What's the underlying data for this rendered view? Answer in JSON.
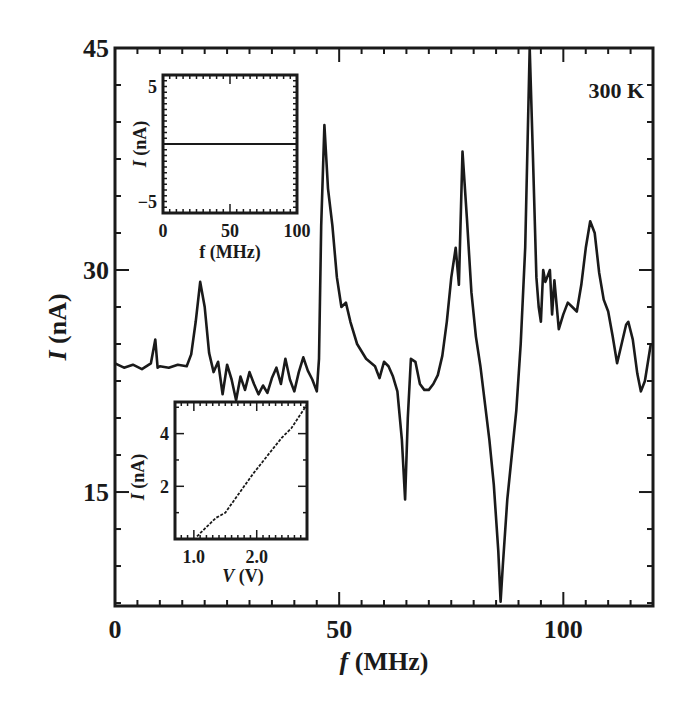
{
  "chart_data": {
    "type": "line",
    "title": "",
    "annotation": "300 K",
    "xlabel_italic": "f",
    "xlabel_rest": " (MHz)",
    "ylabel_italic": "I",
    "ylabel_rest": " (nA)",
    "xlim": [
      0,
      120
    ],
    "ylim": [
      7.3,
      45
    ],
    "xticks": [
      0,
      50,
      100
    ],
    "yticks": [
      15,
      30,
      45
    ],
    "grid": false,
    "legend": null,
    "series": [
      {
        "name": "I vs f at 300 K",
        "x": [
          0,
          2,
          4,
          6,
          8,
          9,
          9.5,
          10,
          12,
          14,
          16,
          17,
          18,
          19,
          20,
          21,
          22,
          23,
          24,
          25,
          26,
          27,
          28,
          29,
          30,
          31,
          32,
          33,
          34,
          35,
          36,
          37,
          38,
          39,
          40,
          41,
          42,
          43,
          44,
          45,
          45.5,
          46,
          46.7,
          47.5,
          48.5,
          49.5,
          50.5,
          51.5,
          52.5,
          54,
          56,
          58,
          59,
          60,
          61,
          62,
          63,
          64,
          64.7,
          65.3,
          66,
          67,
          68,
          69,
          70,
          71,
          72,
          73,
          74,
          75,
          76,
          76.7,
          77.5,
          78.5,
          79.5,
          80.5,
          81.5,
          82.5,
          83.5,
          84.5,
          85.5,
          86,
          86.5,
          87.5,
          88.5,
          89.5,
          90.5,
          91.5,
          92.5,
          93.2,
          94,
          94.5,
          95,
          95.5,
          96,
          97,
          97.5,
          98,
          99,
          100,
          101,
          102,
          103,
          104,
          105,
          106,
          107,
          108,
          109,
          110,
          111,
          112,
          113,
          114,
          114.5,
          115.5,
          116.5,
          117.3,
          118.2,
          119.5
        ],
        "y": [
          23.7,
          23.4,
          23.6,
          23.3,
          23.7,
          25.3,
          23.4,
          23.5,
          23.4,
          23.6,
          23.5,
          24.3,
          26.5,
          29.2,
          27.5,
          24.4,
          23.1,
          23.8,
          21.6,
          23.6,
          22.6,
          21.2,
          22.8,
          21.9,
          23.1,
          22.3,
          21.6,
          22.2,
          21.7,
          22.7,
          23.4,
          22.3,
          24.0,
          22.6,
          21.8,
          23.1,
          24.1,
          23.2,
          22.6,
          21.8,
          24.0,
          33.0,
          39.8,
          35.5,
          33.0,
          29.5,
          27.5,
          27.8,
          26.5,
          25.0,
          24.0,
          23.5,
          22.7,
          23.8,
          23.5,
          22.8,
          21.8,
          18.5,
          14.5,
          20.0,
          24.0,
          23.8,
          22.3,
          21.9,
          21.9,
          22.3,
          22.9,
          24.2,
          26.5,
          29.5,
          31.5,
          29.0,
          38.0,
          33.5,
          28.5,
          25.5,
          23.5,
          21.0,
          18.5,
          15.5,
          11.0,
          7.6,
          10.0,
          14.5,
          17.5,
          20.5,
          25.0,
          31.5,
          45.0,
          38.0,
          29.5,
          27.5,
          26.5,
          30.0,
          29.2,
          30.0,
          27.0,
          29.3,
          26.0,
          27.0,
          27.8,
          27.5,
          27.2,
          29.0,
          31.5,
          33.3,
          32.5,
          29.8,
          28.0,
          27.2,
          25.5,
          23.7,
          25.0,
          26.3,
          26.5,
          25.3,
          23.0,
          21.8,
          22.5,
          25.0
        ]
      }
    ],
    "insets": [
      {
        "type": "line",
        "position": "upper-left",
        "xlabel_italic": "",
        "xlabel_rest": "f (MHz)",
        "ylabel_italic": "I",
        "ylabel_rest": " (nA)",
        "xlim": [
          0,
          100
        ],
        "ylim": [
          -6,
          6
        ],
        "xticks": [
          0,
          50,
          100
        ],
        "yticks": [
          -5,
          5
        ],
        "ytick_labels": [
          "−5",
          "5"
        ],
        "series": [
          {
            "name": "flat zero current",
            "x": [
              0,
              100
            ],
            "y": [
              0,
              0
            ]
          }
        ]
      },
      {
        "type": "line",
        "position": "lower-left",
        "xlabel_italic": "V",
        "xlabel_rest": " (V)",
        "ylabel_italic": "I",
        "ylabel_rest": " (nA)",
        "xlim": [
          0.7,
          2.8
        ],
        "ylim": [
          0,
          5.2
        ],
        "xticks": [
          1.0,
          2.0
        ],
        "xtick_labels": [
          "1.0",
          "2.0"
        ],
        "yticks": [
          2,
          4
        ],
        "series": [
          {
            "name": "I-V curve",
            "x": [
              1.05,
              1.2,
              1.35,
              1.5,
              1.65,
              1.8,
              1.95,
              2.1,
              2.25,
              2.4,
              2.55,
              2.7,
              2.8
            ],
            "y": [
              0.1,
              0.45,
              0.8,
              1.0,
              1.5,
              2.0,
              2.5,
              2.95,
              3.4,
              3.85,
              4.2,
              4.75,
              5.1
            ]
          }
        ]
      }
    ]
  }
}
